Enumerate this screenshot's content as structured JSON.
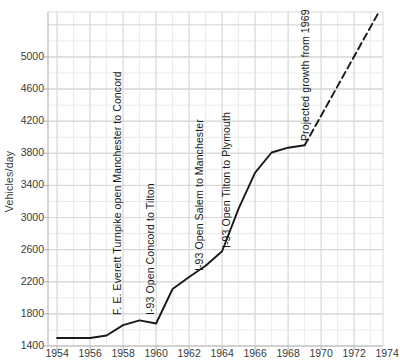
{
  "chart_data": {
    "type": "line",
    "title": "",
    "xlabel": "",
    "ylabel": "Vehicles/day",
    "xlim": [
      1953.45,
      1973.75
    ],
    "ylim": [
      1400,
      5560
    ],
    "grid": true,
    "legend": "none",
    "x_ticks": [
      1954,
      1956,
      1958,
      1960,
      1962,
      1964,
      1966,
      1968,
      1970,
      1972,
      1974
    ],
    "y_ticks": [
      1400,
      1800,
      2200,
      2600,
      3000,
      3400,
      3800,
      4200,
      4600,
      5000
    ],
    "x_minor_step": 1,
    "y_minor_step": 200,
    "series": [
      {
        "name": "Observed traffic",
        "style": "solid",
        "x": [
          1954,
          1956,
          1957,
          1958,
          1959,
          1960,
          1961,
          1962,
          1963,
          1964,
          1965,
          1966,
          1967,
          1968,
          1969
        ],
        "values": [
          1500,
          1500,
          1530,
          1660,
          1720,
          1680,
          2110,
          2260,
          2400,
          2580,
          3110,
          3560,
          3810,
          3870,
          3900
        ]
      },
      {
        "name": "Projected growth",
        "style": "dashed",
        "x": [
          1969,
          1973.5
        ],
        "values": [
          3900,
          5560
        ]
      }
    ],
    "annotations": [
      {
        "id": "everett-turnpike",
        "text": "F. E. Everett Turnpike open Manchester to Concord",
        "x": 1957.0,
        "y_top": 1780
      },
      {
        "id": "i93-concord-tilton",
        "text": "I-93 Open Concord to Tilton",
        "x": 1959.0,
        "y_top": 1780
      },
      {
        "id": "i93-salem-manchester",
        "text": "I-93 Open Salem to Manchester",
        "x": 1962.0,
        "y_top": 2330
      },
      {
        "id": "i93-tilton-plymouth",
        "text": "I-93 Open Tilton to Plymouth",
        "x": 1963.6,
        "y_top": 2620
      },
      {
        "id": "projected-growth",
        "text": "Projected growth from 1969",
        "x": 1968.4,
        "y_top": 3950
      }
    ]
  },
  "colors": {
    "line": "#1a1a1a",
    "grid_major": "#d9d9d9",
    "grid_minor": "#ebebeb",
    "axis": "#bbbbbb",
    "text": "#3a3a3a",
    "background": "#ffffff"
  }
}
